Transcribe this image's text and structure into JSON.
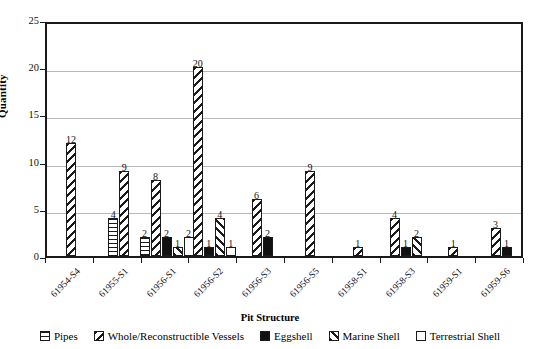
{
  "chart_data": {
    "type": "bar",
    "title": "",
    "xlabel": "Pit Structure",
    "ylabel": "Quantity",
    "ylim": [
      0,
      25
    ],
    "yticks": [
      0,
      5,
      10,
      15,
      20,
      25
    ],
    "grid": true,
    "legend_position": "bottom",
    "categories": [
      "61954-S4",
      "61955-S1",
      "61956-S1",
      "61956-S2",
      "61956-S3",
      "61956-S5",
      "61958-S1",
      "61958-S3",
      "61959-S1",
      "61959-S6"
    ],
    "series": [
      {
        "name": "Pipes",
        "pattern": "horizontal-stripes",
        "values": [
          null,
          4,
          2,
          null,
          null,
          null,
          null,
          null,
          null,
          null
        ]
      },
      {
        "name": "Whole/Reconstructible Vessels",
        "pattern": "back-diagonal-stripes",
        "values": [
          12,
          9,
          8,
          20,
          6,
          9,
          1,
          4,
          1,
          3
        ]
      },
      {
        "name": "Eggshell",
        "pattern": "solid-black",
        "values": [
          null,
          null,
          2,
          1,
          2,
          null,
          null,
          1,
          null,
          1
        ]
      },
      {
        "name": "Marine Shell",
        "pattern": "forward-diagonal-stripes",
        "values": [
          null,
          null,
          1,
          4,
          null,
          null,
          null,
          2,
          null,
          null
        ]
      },
      {
        "name": "Terrestrial Shell",
        "pattern": "dotted",
        "values": [
          null,
          null,
          2,
          1,
          null,
          null,
          null,
          null,
          null,
          null
        ]
      }
    ]
  },
  "axis": {
    "y_label": "Quantity",
    "x_label": "Pit Structure",
    "y_ticks": [
      "0",
      "5",
      "10",
      "15",
      "20",
      "25"
    ]
  },
  "legend": {
    "items": [
      {
        "label": "Pipes",
        "swatch": "pipes-swatch-icon"
      },
      {
        "label": "Whole/Reconstructible Vessels",
        "swatch": "vessels-swatch-icon"
      },
      {
        "label": "Eggshell",
        "swatch": "eggshell-swatch-icon"
      },
      {
        "label": "Marine Shell",
        "swatch": "marine-shell-swatch-icon"
      },
      {
        "label": "Terrestrial Shell",
        "swatch": "terrestrial-shell-swatch-icon"
      }
    ]
  }
}
